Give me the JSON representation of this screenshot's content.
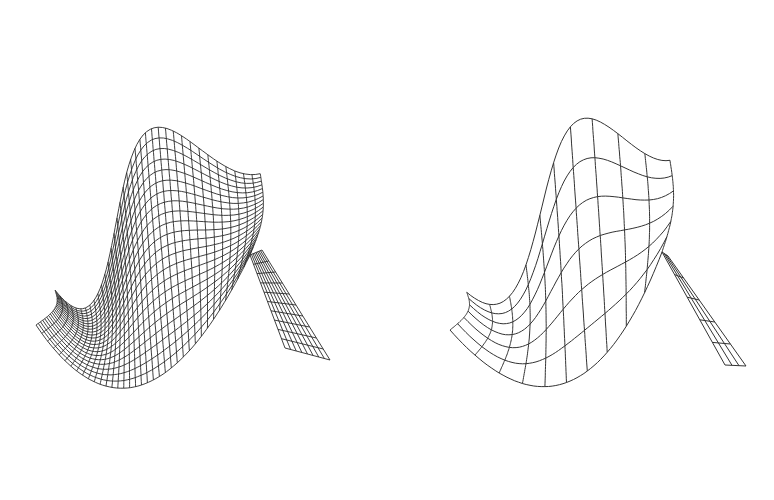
{
  "figure": {
    "background": "#ffffff",
    "line_color": "#2a2a2a",
    "panels": [
      {
        "id": "fine",
        "label": "",
        "mesh_u": 36,
        "mesh_v": 22
      },
      {
        "id": "coarse",
        "label": "",
        "mesh_u": 10,
        "mesh_v": 6
      }
    ]
  }
}
